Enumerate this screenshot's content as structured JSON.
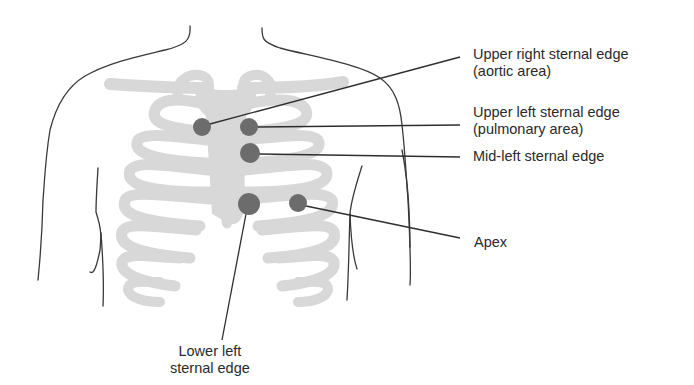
{
  "diagram": {
    "colors": {
      "background": "#ffffff",
      "bone": "#d8d8d8",
      "site_marker": "#6c6c6c",
      "outline": "#3a3a3a",
      "text": "#2a2a2a"
    },
    "sites": [
      {
        "id": "aortic",
        "label_line1": "Upper right sternal edge",
        "label_line2": "(aortic area)",
        "marker": {
          "x": 202,
          "y": 127,
          "r": 9
        }
      },
      {
        "id": "pulmonary",
        "label_line1": "Upper left sternal edge",
        "label_line2": "(pulmonary area)",
        "marker": {
          "x": 249,
          "y": 127,
          "r": 9
        }
      },
      {
        "id": "mid-left",
        "label_line1": "Mid-left sternal edge",
        "marker": {
          "x": 250,
          "y": 153,
          "r": 10
        }
      },
      {
        "id": "lower-left",
        "label_line1": "Lower left",
        "label_line2": "sternal edge",
        "marker": {
          "x": 249,
          "y": 204,
          "r": 11
        }
      },
      {
        "id": "apex",
        "label_line1": "Apex",
        "marker": {
          "x": 298,
          "y": 203,
          "r": 9
        }
      }
    ]
  }
}
